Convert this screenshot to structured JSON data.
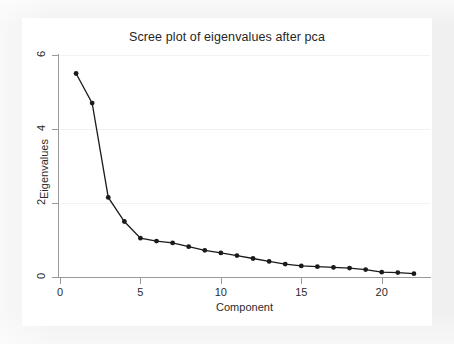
{
  "chart_data": {
    "type": "line",
    "title": "Scree plot of eigenvalues after pca",
    "xlabel": "Component",
    "ylabel": "Eigenvalues",
    "x": [
      1,
      2,
      3,
      4,
      5,
      6,
      7,
      8,
      9,
      10,
      11,
      12,
      13,
      14,
      15,
      16,
      17,
      18,
      19,
      20,
      21,
      22
    ],
    "values": [
      5.5,
      4.7,
      2.15,
      1.5,
      1.05,
      0.97,
      0.92,
      0.82,
      0.72,
      0.65,
      0.58,
      0.5,
      0.42,
      0.35,
      0.3,
      0.28,
      0.26,
      0.24,
      0.2,
      0.13,
      0.12,
      0.09
    ],
    "series": [
      {
        "name": "Eigenvalues",
        "values": [
          5.5,
          4.7,
          2.15,
          1.5,
          1.05,
          0.97,
          0.92,
          0.82,
          0.72,
          0.65,
          0.58,
          0.5,
          0.42,
          0.35,
          0.3,
          0.28,
          0.26,
          0.24,
          0.2,
          0.13,
          0.12,
          0.09
        ]
      }
    ],
    "xlim": [
      0,
      23
    ],
    "ylim": [
      0,
      6
    ],
    "xticks": [
      0,
      5,
      10,
      15,
      20
    ],
    "yticks": [
      0,
      2,
      4,
      6
    ],
    "xtick_labels": [
      "0",
      "5",
      "10",
      "15",
      "20"
    ],
    "ytick_labels": [
      "0",
      "2",
      "4",
      "6"
    ],
    "grid": "horizontal",
    "legend": "none",
    "marker": "filled-circle",
    "line_color": "#1a1a1a",
    "marker_color": "#1a1a1a",
    "grid_color": "#f2f2f2",
    "axis_color": "#9a9a9a",
    "plot_background": "#ffffff",
    "figure_background": "#f1f0f0"
  }
}
